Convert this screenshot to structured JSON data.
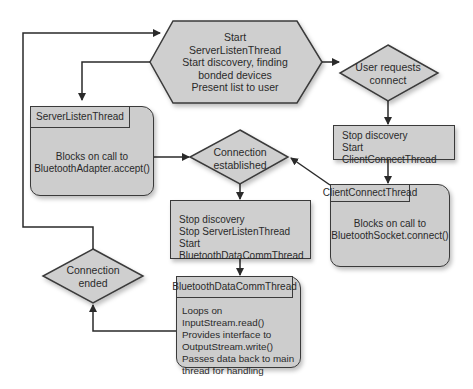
{
  "diagram": {
    "start_node": {
      "lines": [
        "Start",
        "ServerListenThread",
        "Start discovery, finding",
        "bonded devices",
        "Present list to user"
      ]
    },
    "user_requests_decision": {
      "lines": [
        "User requests",
        "connect"
      ]
    },
    "stop_discovery_client_box": {
      "lines": [
        "Stop discovery",
        "Start ClientConnectThread"
      ]
    },
    "client_connect_thread": {
      "title": "ClientConnectThread",
      "lines": [
        "Blocks on call to",
        "BluetoothSocket.connect()"
      ]
    },
    "server_listen_thread": {
      "title": "ServerListenThread",
      "lines": [
        "Blocks on call to",
        "BluetoothAdapter.accept()"
      ]
    },
    "connection_established_decision": {
      "lines": [
        "Connection",
        "established"
      ]
    },
    "stop_server_box": {
      "lines": [
        "Stop discovery",
        "Stop ServerListenThread",
        "Start BluetoothDataCommThread"
      ]
    },
    "data_comm_thread": {
      "title": "BluetoothDataCommThread",
      "lines": [
        "Loops on InputStream.read()",
        "Provides interface to",
        "OutputStream.write()",
        "Passes data back to main",
        "thread for handling"
      ]
    },
    "connection_ended_decision": {
      "lines": [
        "Connection",
        "ended"
      ]
    },
    "colors": {
      "shape_fill": "#cfcfcf",
      "stroke": "#3a3a3a",
      "background": "#ffffff"
    }
  }
}
